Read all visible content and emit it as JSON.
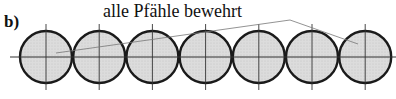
{
  "figure": {
    "panel_label": "b)",
    "annotation": "alle Pfähle bewehrt",
    "pile_count": 7,
    "pile_fill": "#d8d8d8",
    "pile_stroke": "#1a1a1a",
    "axis_color": "#333333",
    "leader_color": "#777777",
    "leader_targets": [
      "pile-1",
      "pile-7"
    ]
  }
}
